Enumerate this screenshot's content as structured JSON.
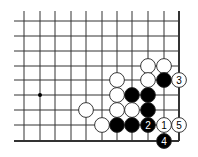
{
  "diagram": {
    "type": "go-board-fragment",
    "columns_x": [
      24,
      40,
      55,
      71,
      86,
      102,
      117,
      132,
      148,
      164,
      179
    ],
    "rows_y": [
      21,
      36,
      51,
      66,
      80,
      95,
      110,
      125,
      141
    ],
    "grid_top": 11,
    "grid_left": 14,
    "right_edge_col": 10,
    "bottom_edge_row": 8,
    "star_points": [
      {
        "col": 1,
        "row": 5
      }
    ],
    "colors": {
      "line": "#333333",
      "black_stone": "#000000",
      "white_stone": "#ffffff",
      "stone_outline": "#222222"
    },
    "stones": [
      {
        "color": "white",
        "col": 8,
        "row": 3,
        "label": ""
      },
      {
        "color": "white",
        "col": 9,
        "row": 3,
        "label": ""
      },
      {
        "color": "white",
        "col": 6,
        "row": 4,
        "label": ""
      },
      {
        "color": "white",
        "col": 8,
        "row": 4,
        "label": ""
      },
      {
        "color": "black",
        "col": 9,
        "row": 4,
        "label": ""
      },
      {
        "color": "white",
        "col": 10,
        "row": 4,
        "label": "3"
      },
      {
        "color": "white",
        "col": 6,
        "row": 5,
        "label": ""
      },
      {
        "color": "black",
        "col": 7,
        "row": 5,
        "label": ""
      },
      {
        "color": "black",
        "col": 8,
        "row": 5,
        "label": ""
      },
      {
        "color": "white",
        "col": 4,
        "row": 6,
        "label": ""
      },
      {
        "color": "white",
        "col": 6,
        "row": 6,
        "label": ""
      },
      {
        "color": "white",
        "col": 7,
        "row": 6,
        "label": ""
      },
      {
        "color": "black",
        "col": 8,
        "row": 6,
        "label": ""
      },
      {
        "color": "white",
        "col": 5,
        "row": 7,
        "label": ""
      },
      {
        "color": "black",
        "col": 6,
        "row": 7,
        "label": ""
      },
      {
        "color": "black",
        "col": 7,
        "row": 7,
        "label": ""
      },
      {
        "color": "black",
        "col": 8,
        "row": 7,
        "label": "2"
      },
      {
        "color": "white",
        "col": 9,
        "row": 7,
        "label": "1"
      },
      {
        "color": "white",
        "col": 10,
        "row": 7,
        "label": "5"
      },
      {
        "color": "black",
        "col": 9,
        "row": 8,
        "label": "4"
      }
    ]
  }
}
